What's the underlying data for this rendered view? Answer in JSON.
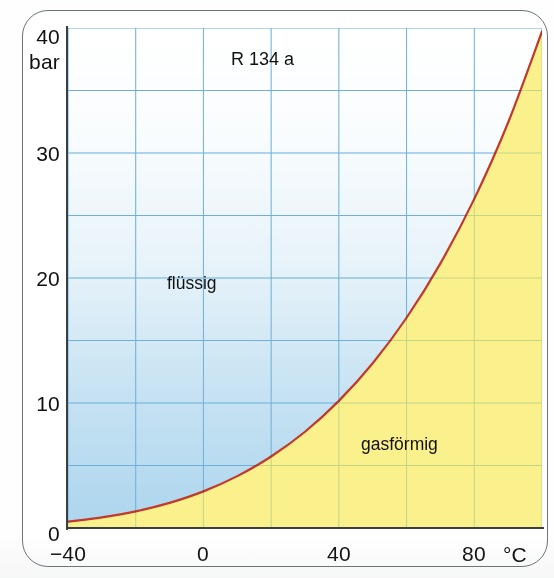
{
  "chart_data": {
    "type": "line",
    "title": "R 134 a",
    "subtitle": "",
    "xlabel": "°C",
    "ylabel": "bar",
    "xlim": [
      -40,
      100
    ],
    "ylim": [
      0,
      40
    ],
    "xticks": [
      -40,
      0,
      40,
      80
    ],
    "xtick_labels": [
      "−40",
      "0",
      "40",
      "80"
    ],
    "yticks": [
      0,
      10,
      20,
      30,
      40
    ],
    "ytick_labels": [
      "0",
      "10",
      "20",
      "30",
      "40"
    ],
    "grid": true,
    "grid_x_step": 20,
    "grid_y_step": 5,
    "grid_color": "#8fc6e6",
    "legend_position": "none",
    "series": [
      {
        "name": "Dampfdruckkurve R 134 a",
        "line_color": "#c0392b",
        "x": [
          -40,
          -30,
          -20,
          -10,
          0,
          10,
          20,
          30,
          40,
          50,
          60,
          70,
          80,
          90,
          100
        ],
        "values": [
          0.51,
          0.85,
          1.33,
          2.01,
          2.93,
          4.15,
          5.72,
          7.7,
          10.17,
          13.18,
          16.82,
          21.17,
          26.33,
          32.44,
          39.72
        ]
      }
    ],
    "regions": [
      {
        "name": "liquid",
        "label": "flüssig",
        "fill_color": "#bfddef"
      },
      {
        "name": "gaseous",
        "label": "gasförmig",
        "fill_color": "#faf08c"
      }
    ],
    "annotations": [
      {
        "name": "refrigerant-title",
        "text": "R 134 a",
        "x": 20,
        "y": 37.5
      },
      {
        "name": "liquid-label",
        "text": "flüssig",
        "x": -2,
        "y": 20
      },
      {
        "name": "gas-label",
        "text": "gasförmig",
        "x": 59,
        "y": 7.2
      }
    ]
  },
  "axes": {
    "y_top_value": "40",
    "y_unit": "bar",
    "x_unit": "°C"
  }
}
